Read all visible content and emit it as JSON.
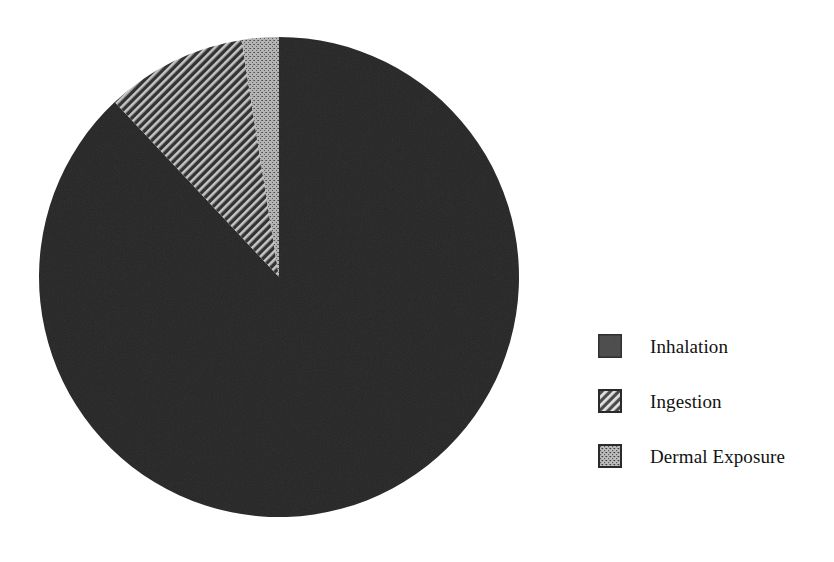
{
  "chart_data": {
    "type": "pie",
    "title": "",
    "subtitle": "",
    "xlabel": "",
    "ylabel": "",
    "grid": false,
    "legend_position": "right",
    "start_angle_deg": 90,
    "direction": "counterclockwise",
    "categories": [
      "Inhalation",
      "Ingestion",
      "Dermal Exposure"
    ],
    "values": [
      88.0,
      9.5,
      2.5
    ],
    "units": "percent",
    "slices": [
      {
        "label": "Inhalation",
        "value": 88.0,
        "pattern": "solid",
        "color": "#262626",
        "angle_deg": 316.8
      },
      {
        "label": "Ingestion",
        "value": 9.5,
        "pattern": "diagonal-hatch",
        "color": "#3a3a3a",
        "angle_deg": 34.2
      },
      {
        "label": "Dermal Exposure",
        "value": 2.5,
        "pattern": "speckle",
        "color": "#9a9a9a",
        "angle_deg": 9.0
      }
    ]
  },
  "legend": {
    "items": [
      {
        "label": "Inhalation",
        "swatch": "solid-swatch-icon"
      },
      {
        "label": "Ingestion",
        "swatch": "hatch-swatch-icon"
      },
      {
        "label": "Dermal Exposure",
        "swatch": "speckle-swatch-icon"
      }
    ]
  },
  "colors": {
    "background": "#ffffff",
    "text": "#121212",
    "slice_inhalation": "#262626",
    "slice_ingestion": "#3a3a3a",
    "slice_dermal": "#9a9a9a",
    "hatch_line": "#c8c8c8",
    "swatch_border": "#2a2a2a"
  }
}
